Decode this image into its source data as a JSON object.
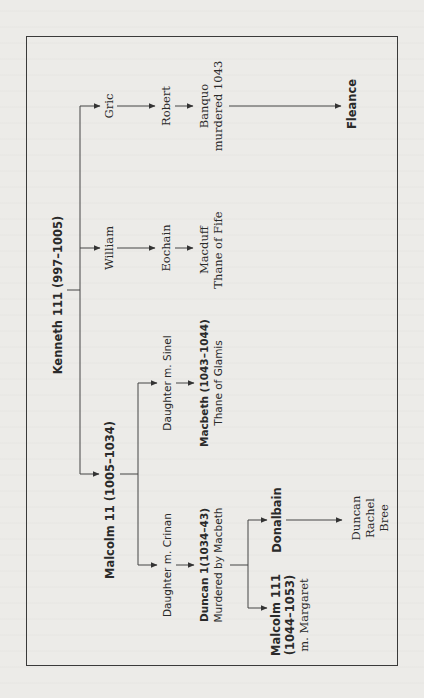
{
  "diagram": {
    "type": "family-tree",
    "orientation": "rotated-90-ccw",
    "nodes": {
      "kenneth": {
        "name": "Kenneth 111",
        "dates": "(997–1005)"
      },
      "malcolm2": {
        "name": "Malcolm 11",
        "dates": "(1005–1034)"
      },
      "william": {
        "name": "William"
      },
      "eochain": {
        "name": "Eochain"
      },
      "macduff": {
        "line1": "Macduff",
        "line2": "Thane of Fife"
      },
      "gric": {
        "name": "Gric"
      },
      "robert": {
        "name": "Robert"
      },
      "banquo": {
        "line1": "Banquo",
        "line2": "murdered 1043"
      },
      "fleance": {
        "name": "Fleance"
      },
      "daughter_sinel": {
        "name": "Daughter m. Sinel"
      },
      "macbeth": {
        "line1": "Macbeth (1043–1044)",
        "line2": "Thane of Glamis"
      },
      "daughter_crinan": {
        "name": "Daughter m. Crinan"
      },
      "duncan1": {
        "line1": "Duncan 1(1034–43)",
        "line2": "Murdered by Macbeth"
      },
      "donalbain": {
        "name": "Donalbain"
      },
      "malcolm3": {
        "line1": "Malcolm 111",
        "line2": "(1044–1053)",
        "line3": "m. Margaret"
      },
      "donalbain_children": {
        "line1": "Duncan",
        "line2": "Rachel",
        "line3": "Bree"
      }
    },
    "edges": [
      [
        "kenneth",
        "william"
      ],
      [
        "kenneth",
        "gric"
      ],
      [
        "kenneth",
        "malcolm2"
      ],
      [
        "william",
        "eochain"
      ],
      [
        "eochain",
        "macduff"
      ],
      [
        "gric",
        "robert"
      ],
      [
        "robert",
        "banquo"
      ],
      [
        "banquo",
        "fleance"
      ],
      [
        "malcolm2",
        "daughter_sinel"
      ],
      [
        "daughter_sinel",
        "macbeth"
      ],
      [
        "malcolm2",
        "daughter_crinan"
      ],
      [
        "daughter_crinan",
        "duncan1"
      ],
      [
        "duncan1",
        "donalbain"
      ],
      [
        "duncan1",
        "malcolm3"
      ],
      [
        "donalbain",
        "donalbain_children"
      ]
    ]
  }
}
